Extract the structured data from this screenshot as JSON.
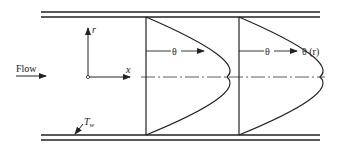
{
  "labels": {
    "flow": "Flow",
    "r_axis": "r",
    "x_axis": "x",
    "wall_temp": "T",
    "wall_temp_sub": "w",
    "theta1": "θ",
    "theta2": "θ",
    "theta_r": "θ (r)"
  },
  "colors": {
    "line": "#222222",
    "background": "#ffffff"
  }
}
